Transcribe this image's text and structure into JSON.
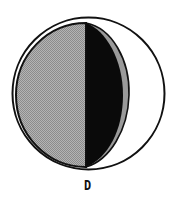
{
  "figure": {
    "label": "D",
    "colors": {
      "background": "#ffffff",
      "outline": "#111111",
      "gray_fill": "#a0a0a0",
      "dark_fill": "#0a0a0a",
      "sliver_fill": "#9a9a9a"
    }
  }
}
